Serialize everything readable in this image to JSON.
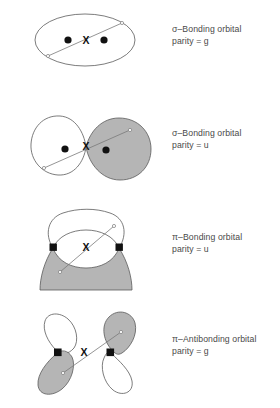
{
  "figure": {
    "background_color": "#ffffff",
    "outline_color": "#555555",
    "shaded_lobe_color": "#b5b5b5",
    "marker_color": "#000000",
    "text_color": "#4a4a4a",
    "center_marker_label": "X"
  },
  "rows": [
    {
      "id": "sigma-bonding-g",
      "symmetry_label": "σ–Bonding orbital",
      "parity_label": "parity = g",
      "parity_value": "g",
      "orbital_type": "σ-bonding",
      "diagram": {
        "shape": "single-ellipse",
        "lobe_count": 1,
        "shaded_lobes": 0,
        "nucleus_marker": "circle",
        "nucleus_count": 2,
        "center_label": "X",
        "has_internuclear_axis": true
      }
    },
    {
      "id": "sigma-bonding-u",
      "symmetry_label": "σ–Bonding orbital",
      "parity_label": "parity = u",
      "parity_value": "u",
      "orbital_type": "σ-bonding",
      "diagram": {
        "shape": "two-blobs",
        "lobe_count": 2,
        "shaded_lobes": 1,
        "nucleus_marker": "circle",
        "nucleus_count": 2,
        "center_label": "X",
        "has_internuclear_axis": true
      }
    },
    {
      "id": "pi-bonding-u",
      "symmetry_label": "π–Bonding orbital",
      "parity_label": "parity = u",
      "parity_value": "u",
      "orbital_type": "π-bonding",
      "diagram": {
        "shape": "upper-lower-lobes",
        "lobe_count": 2,
        "shaded_lobes": 1,
        "nucleus_marker": "square",
        "nucleus_count": 2,
        "center_label": "X",
        "has_internuclear_axis": true
      }
    },
    {
      "id": "pi-antibonding-g",
      "symmetry_label": "π–Antibonding orbital",
      "parity_label": "parity = g",
      "parity_value": "g",
      "orbital_type": "π-antibonding",
      "diagram": {
        "shape": "four-teardrop-lobes",
        "lobe_count": 4,
        "shaded_lobes": 2,
        "nucleus_marker": "square",
        "nucleus_count": 2,
        "center_label": "X",
        "has_internuclear_axis": true
      }
    }
  ]
}
